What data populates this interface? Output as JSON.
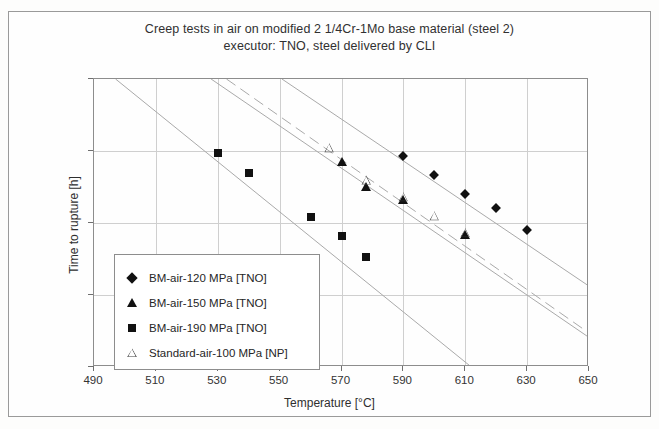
{
  "chart_data": {
    "type": "scatter",
    "title": "Creep tests in air on modified 2 1/4Cr-1Mo base material (steel 2)",
    "subtitle": "executor: TNO, steel delivered by CLI",
    "xlabel": "Temperature [°C]",
    "ylabel": "Time to rupture [h]",
    "xlim": [
      490,
      650
    ],
    "ylim": [
      10,
      100000
    ],
    "yscale": "log",
    "grid": true,
    "legend_position": "lower-left-inside",
    "xticks": [
      "490",
      "510",
      "530",
      "550",
      "570",
      "590",
      "610",
      "630",
      "650"
    ],
    "yticks": [
      "10⁵",
      "10⁴",
      "10³",
      "10²",
      "10¹"
    ],
    "ytick_exponents": [
      5,
      4,
      3,
      2,
      1
    ],
    "series": [
      {
        "name": "BM-air-120 MPa [TNO]",
        "marker": "diamond-filled",
        "color": "#111111",
        "points": [
          {
            "x": 590,
            "y": 8500
          },
          {
            "x": 600,
            "y": 4700
          },
          {
            "x": 610,
            "y": 2500
          },
          {
            "x": 620,
            "y": 1600
          },
          {
            "x": 630,
            "y": 800
          }
        ]
      },
      {
        "name": "BM-air-150 MPa [TNO]",
        "marker": "triangle-filled",
        "color": "#111111",
        "points": [
          {
            "x": 570,
            "y": 7000
          },
          {
            "x": 578,
            "y": 3200
          },
          {
            "x": 590,
            "y": 2100
          },
          {
            "x": 610,
            "y": 680
          }
        ]
      },
      {
        "name": "BM-air-190 MPa [TNO]",
        "marker": "square-filled",
        "color": "#111111",
        "points": [
          {
            "x": 530,
            "y": 9500
          },
          {
            "x": 540,
            "y": 5000
          },
          {
            "x": 560,
            "y": 1200
          },
          {
            "x": 570,
            "y": 670
          },
          {
            "x": 578,
            "y": 340
          }
        ]
      },
      {
        "name": "Standard-air-100 MPa [NP]",
        "marker": "triangle-open",
        "color": "#4a4a4a",
        "points": [
          {
            "x": 566,
            "y": 11000
          },
          {
            "x": 578,
            "y": 3900
          },
          {
            "x": 590,
            "y": 2300
          },
          {
            "x": 600,
            "y": 1250
          },
          {
            "x": 610,
            "y": 730
          }
        ]
      }
    ],
    "trendlines": [
      {
        "name": "trend-190MPa",
        "style": "solid",
        "x1": 497,
        "y1": 100000,
        "x2": 612,
        "y2": 10
      },
      {
        "name": "trend-150MPa",
        "style": "solid",
        "x1": 528,
        "y1": 100000,
        "x2": 650,
        "y2": 26
      },
      {
        "name": "trend-standard-100MPa",
        "style": "dashed",
        "x1": 533,
        "y1": 100000,
        "x2": 650,
        "y2": 30
      },
      {
        "name": "trend-120MPa",
        "style": "solid",
        "x1": 551,
        "y1": 100000,
        "x2": 650,
        "y2": 135
      }
    ]
  },
  "legend": {
    "items": [
      {
        "label": "BM-air-120 MPa [TNO]",
        "marker": "diamond-filled"
      },
      {
        "label": "BM-air-150 MPa [TNO]",
        "marker": "triangle-filled"
      },
      {
        "label": "BM-air-190 MPa [TNO]",
        "marker": "square-filled"
      },
      {
        "label": "Standard-air-100 MPa [NP]",
        "marker": "triangle-open"
      }
    ]
  }
}
